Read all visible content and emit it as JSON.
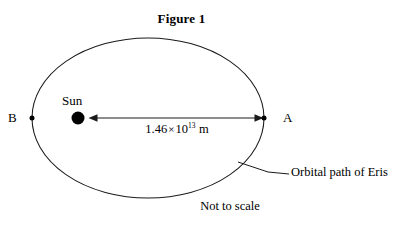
{
  "figure": {
    "title": "Figure 1",
    "top_clipped_text": "tion coefficient and the mass of the block on the surface is",
    "not_to_scale_note": "Not to scale"
  },
  "diagram": {
    "orbit": {
      "callout_label": "Orbital path of Eris",
      "stroke_color": "#1a1a1a",
      "center_x": 148,
      "center_y": 118,
      "radius_x": 116,
      "radius_y": 80
    },
    "sun": {
      "label": "Sun",
      "fill_color": "#000000",
      "center_x": 78,
      "center_y": 118,
      "radius": 6.5
    },
    "points": [
      {
        "id": "B",
        "label": "B",
        "x": 32,
        "y": 118
      },
      {
        "id": "A",
        "label": "A",
        "x": 264,
        "y": 118
      }
    ],
    "distance_arrow": {
      "label_mantissa": "1.46",
      "label_times": "×",
      "label_base": "10",
      "label_exponent": "13",
      "label_unit": "m",
      "from_x": 90,
      "to_x": 262,
      "y": 118,
      "double_headed": true
    },
    "callout_leader": {
      "from_x": 238,
      "from_y": 162,
      "to_x": 289,
      "to_y": 174
    }
  },
  "colors": {
    "background": "#ffffff",
    "ink": "#000000",
    "line": "#1a1a1a",
    "faint_text": "#c9c9cf"
  }
}
